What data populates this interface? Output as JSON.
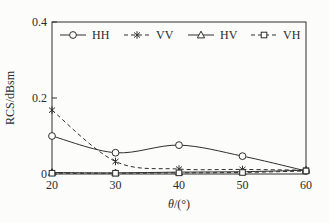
{
  "chart_data": {
    "type": "line",
    "title": "",
    "xlabel_theta": "θ",
    "xlabel_rest": "/(°)",
    "ylabel": "RCS/dBsm",
    "x": [
      20,
      30,
      40,
      50,
      60
    ],
    "xlim": [
      20,
      60
    ],
    "ylim": [
      0,
      0.4
    ],
    "xtick_labels": [
      "20",
      "30",
      "40",
      "50",
      "60"
    ],
    "xtick_values": [
      20,
      30,
      40,
      50,
      60
    ],
    "ytick_labels": [
      "0",
      "0.2",
      "0.4"
    ],
    "ytick_values": [
      0,
      0.2,
      0.4
    ],
    "grid": false,
    "legend_position": "top-inside-row",
    "line_color": "#2e2e2e",
    "background": "#fcfcfa",
    "series": [
      {
        "name": "HH",
        "marker": "circle",
        "line": "solid",
        "values": [
          0.1,
          0.056,
          0.076,
          0.047,
          0.008
        ]
      },
      {
        "name": "VV",
        "marker": "asterisk",
        "line": "dashed",
        "values": [
          0.168,
          0.033,
          0.013,
          0.012,
          0.01
        ]
      },
      {
        "name": "HV",
        "marker": "triangle",
        "line": "solid",
        "values": [
          0.004,
          0.003,
          0.005,
          0.006,
          0.01
        ]
      },
      {
        "name": "VH",
        "marker": "square",
        "line": "dashed",
        "values": [
          0.002,
          0.002,
          0.003,
          0.004,
          0.008
        ]
      }
    ]
  }
}
